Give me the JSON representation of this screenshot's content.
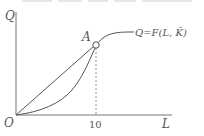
{
  "diagram": {
    "type": "production-function",
    "axes": {
      "y_label": "Q",
      "x_label": "L",
      "origin_label": "O"
    },
    "x_ticks": [
      {
        "value": 10,
        "label": "10"
      }
    ],
    "point": {
      "label": "A",
      "x_value": 10,
      "marker": "open-circle"
    },
    "curves": [
      {
        "name": "total-product-curve",
        "label": "Q=F(L, K̄)",
        "shape": "s-curve"
      },
      {
        "name": "ray-from-origin",
        "label": "",
        "shape": "straight-line-from-O-to-A"
      }
    ],
    "guide_lines": [
      {
        "name": "dashed-drop-from-A",
        "from": "A",
        "to": "x-axis at 10"
      }
    ]
  },
  "colors": {
    "line": "#555555",
    "axis": "#777777",
    "background": "#ffffff"
  }
}
